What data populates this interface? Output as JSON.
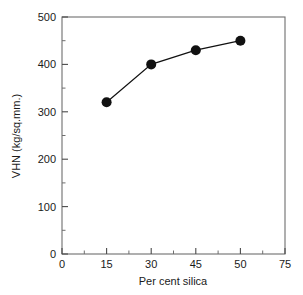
{
  "chart_data": {
    "type": "line",
    "title": "",
    "xlabel": "Per cent silica",
    "ylabel": "VHN (kg/sq.mm.)",
    "xlim": [
      0,
      75
    ],
    "ylim": [
      0,
      500
    ],
    "grid": false,
    "legend": null,
    "x_ticks": [
      {
        "value": 0,
        "label": "0"
      },
      {
        "value": 15,
        "label": "15"
      },
      {
        "value": 30,
        "label": "30"
      },
      {
        "value": 45,
        "label": "45"
      },
      {
        "value": 60,
        "label": "50"
      },
      {
        "value": 75,
        "label": "75"
      }
    ],
    "x_minor_step": 7.5,
    "y_ticks": [
      {
        "value": 0,
        "label": "0"
      },
      {
        "value": 100,
        "label": "100"
      },
      {
        "value": 200,
        "label": "200"
      },
      {
        "value": 300,
        "label": "300"
      },
      {
        "value": 400,
        "label": "400"
      },
      {
        "value": 500,
        "label": "500"
      }
    ],
    "y_minor_step": 50,
    "series": [
      {
        "name": "VHN vs per cent silica",
        "marker": "filled-circle",
        "color": "#111111",
        "x": [
          15,
          30,
          45,
          60
        ],
        "x_tick_labels": [
          "15",
          "30",
          "45",
          "50"
        ],
        "values": [
          320,
          400,
          430,
          450
        ]
      }
    ]
  },
  "axis_titles": {
    "x": "Per cent silica",
    "y": "VHN (kg/sq.mm.)"
  }
}
